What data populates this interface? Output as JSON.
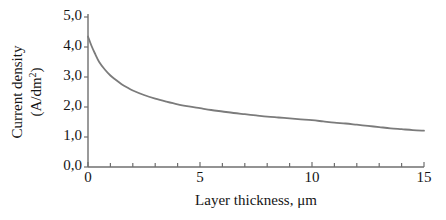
{
  "chart_data": {
    "type": "line",
    "title": "",
    "xlabel": "Layer thickness,  μm",
    "ylabel_line1": "Current  density",
    "ylabel_line2": "(A/dm",
    "ylabel_sup": "2",
    "ylabel_line2_end": ")",
    "ylabel_full": "Current density (A/dm2)",
    "xlim": [
      0,
      15
    ],
    "ylim": [
      0,
      5
    ],
    "xticks": [
      0,
      5,
      10,
      15
    ],
    "xtick_labels": [
      "0",
      "5",
      "10",
      "15"
    ],
    "xminor_step": 1,
    "yticks": [
      0,
      1,
      2,
      3,
      4,
      5
    ],
    "ytick_labels": [
      "0,0",
      "1,0",
      "2,0",
      "3,0",
      "4,0",
      "5,0"
    ],
    "grid": false,
    "legend": null,
    "series": [
      {
        "name": "current density",
        "color": "#7b7b7b",
        "line_width": 1.8,
        "x": [
          0.0,
          0.15,
          0.3,
          0.5,
          0.75,
          1.0,
          1.25,
          1.5,
          1.75,
          2.0,
          2.5,
          3.0,
          3.5,
          4.0,
          4.5,
          5.0,
          5.5,
          6.0,
          6.5,
          7.0,
          7.5,
          8.0,
          8.5,
          9.0,
          9.5,
          10.0,
          10.5,
          11.0,
          11.5,
          12.0,
          12.5,
          13.0,
          13.5,
          14.0,
          14.5,
          15.0
        ],
        "y": [
          4.35,
          4.05,
          3.8,
          3.5,
          3.25,
          3.05,
          2.9,
          2.76,
          2.65,
          2.55,
          2.4,
          2.28,
          2.18,
          2.09,
          2.02,
          1.96,
          1.9,
          1.85,
          1.8,
          1.76,
          1.72,
          1.68,
          1.65,
          1.62,
          1.59,
          1.56,
          1.52,
          1.48,
          1.45,
          1.41,
          1.37,
          1.33,
          1.29,
          1.26,
          1.23,
          1.21
        ]
      }
    ]
  },
  "axes": {
    "axis_color": "#6f6f6f",
    "tick_color": "#6f6f6f",
    "background": "#ffffff"
  }
}
